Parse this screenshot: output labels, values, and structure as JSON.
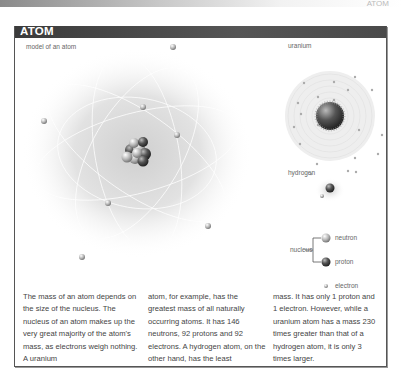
{
  "page": {
    "corner_label": "ATOM"
  },
  "panel": {
    "title": "ATOM",
    "main_diagram": {
      "label": "model of an atom",
      "electron_count": 9
    },
    "uranium": {
      "label": "uranium",
      "neutrons": 146,
      "protons": 92,
      "electrons": 92
    },
    "hydrogen": {
      "label": "hydrogen",
      "protons": 1,
      "electrons": 1
    },
    "legend": {
      "group_label": "nucleus",
      "items": [
        {
          "name": "neutron",
          "color": "#d8d8d8"
        },
        {
          "name": "proton",
          "color": "#444444"
        },
        {
          "name": "electron",
          "color": "#bbbbbb"
        }
      ]
    },
    "text_columns": [
      "The mass of an atom depends on the size of the nucleus. The nucleus of an atom makes up the very great majority of the atom's mass, as electrons weigh nothing. A uranium",
      "atom, for example, has the greatest mass of all naturally occurring atoms. It has 146 neutrons, 92 protons and 92 electrons. A hydrogen atom, on the other hand, has the least",
      "mass. It has only 1 proton and 1 electron. However, while a uranium atom has a mass 230 times greater than that of a hydrogen atom, it is only 3 times larger."
    ]
  }
}
